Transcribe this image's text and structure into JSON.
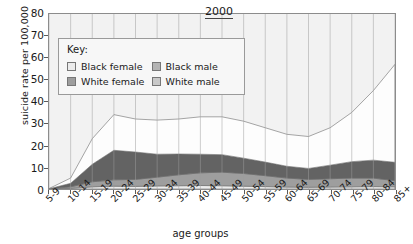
{
  "chart_data": {
    "type": "area",
    "stacked": true,
    "title": "2000",
    "xlabel": "age groups",
    "ylabel": "suicide rate per 100,000",
    "ylim": [
      0,
      80
    ],
    "yticks": [
      0,
      10,
      20,
      30,
      40,
      50,
      60,
      70,
      80
    ],
    "grid": true,
    "legend_position": "inside-top-left",
    "legend_title": "Key:",
    "categories": [
      "5-9",
      "10-14",
      "15-19",
      "20-24",
      "25-29",
      "30-34",
      "35-39",
      "40-44",
      "45-49",
      "50-54",
      "55-59",
      "60-64",
      "65-69",
      "70-74",
      "75-79",
      "80-84",
      "85+"
    ],
    "series": [
      {
        "name": "Black female",
        "color": "#ececec",
        "values": [
          0.0,
          0.3,
          1.0,
          1.3,
          1.2,
          1.4,
          1.5,
          1.6,
          1.5,
          1.3,
          1.1,
          0.9,
          0.8,
          0.9,
          1.0,
          1.1,
          1.0
        ]
      },
      {
        "name": "White female",
        "color": "#9e9e9e",
        "values": [
          0.0,
          0.7,
          2.3,
          2.9,
          3.2,
          4.0,
          5.0,
          5.8,
          6.2,
          5.8,
          5.0,
          4.1,
          3.6,
          3.8,
          4.0,
          3.9,
          2.8
        ]
      },
      {
        "name": "Black male",
        "color": "#636363",
        "values": [
          0.1,
          1.6,
          8.0,
          13.5,
          12.5,
          10.5,
          9.5,
          8.5,
          8.0,
          7.0,
          6.2,
          5.4,
          5.0,
          6.2,
          7.5,
          8.2,
          8.4
        ]
      },
      {
        "name": "White male",
        "color": "#fdfdfd",
        "values": [
          0.1,
          2.4,
          11.7,
          16.3,
          15.1,
          15.6,
          16.0,
          17.1,
          17.3,
          16.9,
          15.7,
          14.6,
          14.6,
          17.1,
          22.5,
          31.8,
          44.8
        ]
      }
    ],
    "totals": [
      0.2,
      5.0,
      23.0,
      34.0,
      32.0,
      31.5,
      32.0,
      33.0,
      33.0,
      31.0,
      28.0,
      25.0,
      24.0,
      28.0,
      35.0,
      45.0,
      57.0
    ]
  },
  "chart": {
    "title": "2000",
    "ylabel": "suicide rate per 100,000",
    "xlabel": "age groups",
    "yticks": [
      "80",
      "70",
      "60",
      "50",
      "40",
      "30",
      "20",
      "10",
      "0"
    ],
    "categories": [
      "5-9",
      "10-14",
      "15-19",
      "20-24",
      "25-29",
      "30-34",
      "35-39",
      "40-44",
      "45-49",
      "50-54",
      "55-59",
      "60-64",
      "65-69",
      "70-74",
      "75-79",
      "80-84",
      "85+"
    ]
  },
  "legend": {
    "title": "Key:",
    "items": [
      {
        "label": "Black female",
        "color": "#ececec"
      },
      {
        "label": "Black male",
        "color": "#b4b4b4"
      },
      {
        "label": "White female",
        "color": "#9e9e9e"
      },
      {
        "label": "White male",
        "color": "#c9c9c9"
      }
    ]
  }
}
